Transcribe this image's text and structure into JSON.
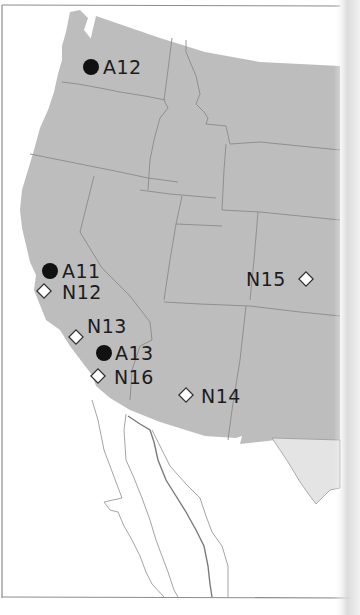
{
  "map": {
    "region": "Western United States",
    "colors": {
      "land": "#bdbdbd",
      "state_border": "#8a8a8a",
      "mexico_land": "#e4e4e4",
      "marker_filled": "#111111",
      "marker_open_fill": "#ffffff",
      "marker_open_stroke": "#333333",
      "label": "#1c1c1c"
    },
    "legend_symbols": {
      "filled_circle": "A-series site",
      "open_diamond": "N-series site"
    },
    "markers": [
      {
        "id": "A12",
        "label": "A12",
        "shape": "filled-circle",
        "location": "Washington (Seattle area)",
        "label_side": "right"
      },
      {
        "id": "A11",
        "label": "A11",
        "shape": "filled-circle",
        "location": "Northern California (Bay Area)",
        "label_side": "right"
      },
      {
        "id": "N12",
        "label": "N12",
        "shape": "open-diamond",
        "location": "Northern California (Bay Area coast)",
        "label_side": "right"
      },
      {
        "id": "N13",
        "label": "N13",
        "shape": "open-diamond",
        "location": "Central California coast",
        "label_side": "right"
      },
      {
        "id": "A13",
        "label": "A13",
        "shape": "filled-circle",
        "location": "Southern California (Los Angeles area)",
        "label_side": "right"
      },
      {
        "id": "N16",
        "label": "N16",
        "shape": "open-diamond",
        "location": "Southern California (San Diego area)",
        "label_side": "right"
      },
      {
        "id": "N14",
        "label": "N14",
        "shape": "open-diamond",
        "location": "Southern Arizona",
        "label_side": "right"
      },
      {
        "id": "N15",
        "label": "N15",
        "shape": "open-diamond",
        "location": "Colorado",
        "label_side": "left"
      }
    ]
  }
}
